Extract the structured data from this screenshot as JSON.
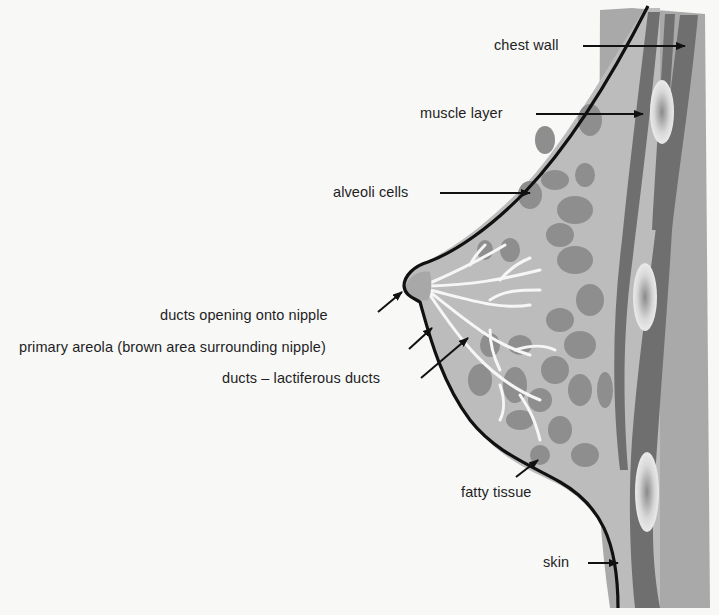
{
  "diagram": {
    "labels": {
      "chest_wall": "chest wall",
      "muscle_layer": "muscle layer",
      "alveoli_cells": "alveoli cells",
      "ducts_opening": "ducts opening onto nipple",
      "primary_areola": "primary areola (brown area surrounding nipple)",
      "lactiferous_ducts": "ducts – lactiferous ducts",
      "fatty_tissue": "fatty tissue",
      "skin": "skin"
    },
    "colors": {
      "background": "#f8f8f7",
      "tissue_light": "#bdbdbd",
      "tissue_mid": "#a3a3a3",
      "lobules": "#8f8f8f",
      "muscle_dark": "#6e6e6e",
      "ducts": "#f4f4f4",
      "outline": "#111111"
    }
  }
}
